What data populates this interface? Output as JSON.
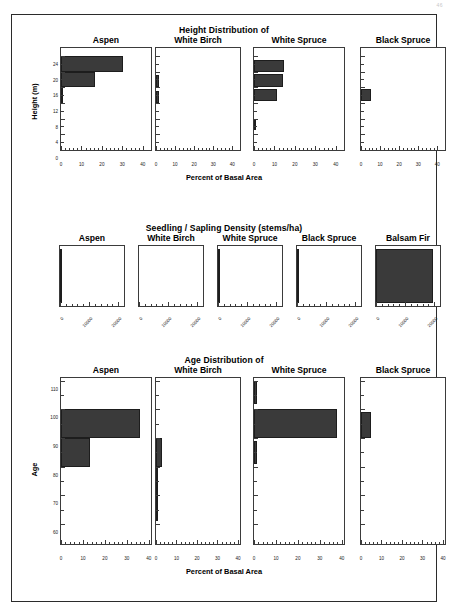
{
  "page": {
    "page_number": "46"
  },
  "chart_data": [
    {
      "type": "bar",
      "orientation": "horizontal",
      "title": "Height Distribution of",
      "xlabel": "Percent of Basal Area",
      "ylabel": "Height (m)",
      "xlim": [
        0,
        44
      ],
      "ylim": [
        0,
        26
      ],
      "xticks": [
        0,
        10,
        20,
        30,
        40
      ],
      "xtick_labels": [
        "0",
        "10",
        "20",
        "30",
        "40"
      ],
      "yticks": [
        0,
        4,
        8,
        12,
        16,
        20,
        24
      ],
      "ytick_labels": [
        "0",
        "4",
        "8",
        "12",
        "16",
        "20",
        "24"
      ],
      "grid": false,
      "legend": "none",
      "panels": [
        {
          "label": "Aspen",
          "bars": [
            {
              "y_low": 20,
              "y_high": 24,
              "value": 30.5
            },
            {
              "y_low": 16,
              "y_high": 20,
              "value": 16.5
            },
            {
              "y_low": 12,
              "y_high": 16,
              "value": 0.8
            }
          ]
        },
        {
          "label": "White Birch",
          "bars": [
            {
              "y_low": 16,
              "y_high": 19,
              "value": 1.6
            },
            {
              "y_low": 12,
              "y_high": 15,
              "value": 1.6
            }
          ]
        },
        {
          "label": "White Spruce",
          "bars": [
            {
              "y_low": 20,
              "y_high": 23,
              "value": 14.5
            },
            {
              "y_low": 16,
              "y_high": 19.5,
              "value": 14.0
            },
            {
              "y_low": 12.5,
              "y_high": 15.5,
              "value": 11.0
            },
            {
              "y_low": 5,
              "y_high": 8,
              "value": 0.6
            }
          ]
        },
        {
          "label": "Black Spruce",
          "bars": [
            {
              "y_low": 12.5,
              "y_high": 15.5,
              "value": 5.0
            }
          ]
        }
      ]
    },
    {
      "type": "bar",
      "orientation": "horizontal",
      "title": "Seedling / Sapling Density (stems/ha)",
      "xlabel": "",
      "ylabel": "",
      "xlim": [
        0,
        22000
      ],
      "ylim": [
        0,
        1
      ],
      "xticks": [
        0,
        10000,
        20000
      ],
      "xtick_labels": [
        "0",
        "10000",
        "20000"
      ],
      "grid": false,
      "legend": "none",
      "panels": [
        {
          "label": "Aspen",
          "bars": [
            {
              "y_low": 0.05,
              "y_high": 0.95,
              "value": 330
            }
          ]
        },
        {
          "label": "White Birch",
          "bars": []
        },
        {
          "label": "White Spruce",
          "bars": [
            {
              "y_low": 0.05,
              "y_high": 0.95,
              "value": 120
            }
          ]
        },
        {
          "label": "Black Spruce",
          "bars": [
            {
              "y_low": 0.05,
              "y_high": 0.95,
              "value": 300
            }
          ]
        },
        {
          "label": "Balsam Fir",
          "bars": [
            {
              "y_low": 0.05,
              "y_high": 0.95,
              "value": 19500
            }
          ]
        }
      ]
    },
    {
      "type": "bar",
      "orientation": "horizontal",
      "title": "Age Distribution of",
      "xlabel": "Percent of Basal Area",
      "ylabel": "Age",
      "xlim": [
        0,
        41
      ],
      "ylim": [
        53,
        111
      ],
      "xticks": [
        0,
        10,
        20,
        30,
        40
      ],
      "xtick_labels": [
        "0",
        "10",
        "20",
        "30",
        "40"
      ],
      "yticks": [
        60,
        70,
        80,
        90,
        100,
        110
      ],
      "ytick_labels": [
        "60",
        "70",
        "80",
        "90",
        "100",
        "110"
      ],
      "grid": false,
      "legend": "none",
      "panels": [
        {
          "label": "Aspen",
          "bars": [
            {
              "y_low": 90,
              "y_high": 100,
              "value": 36.0
            },
            {
              "y_low": 80,
              "y_high": 90,
              "value": 13.0
            }
          ]
        },
        {
          "label": "White Birch",
          "bars": [
            {
              "y_low": 80,
              "y_high": 90,
              "value": 2.9
            },
            {
              "y_low": 70,
              "y_high": 80,
              "value": 0.9
            },
            {
              "y_low": 61,
              "y_high": 70,
              "value": 0.5
            }
          ]
        },
        {
          "label": "White Spruce",
          "bars": [
            {
              "y_low": 102,
              "y_high": 110,
              "value": 1.4
            },
            {
              "y_low": 90,
              "y_high": 100,
              "value": 38.0
            },
            {
              "y_low": 81,
              "y_high": 89,
              "value": 1.3
            }
          ]
        },
        {
          "label": "Black Spruce",
          "bars": [
            {
              "y_low": 90,
              "y_high": 99,
              "value": 5.0
            }
          ]
        }
      ]
    }
  ],
  "colors": {
    "bar_fill": "#3a3a3a",
    "axis": "#3b3b3b",
    "frame": "#2b2b2b"
  }
}
